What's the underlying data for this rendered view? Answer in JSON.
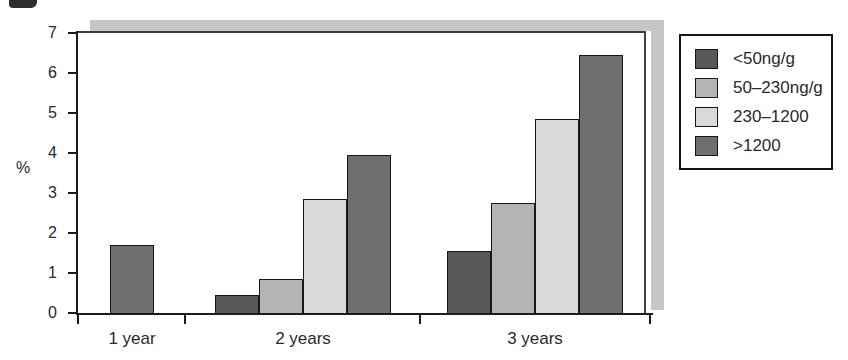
{
  "chart_data": {
    "type": "bar",
    "title": "",
    "xlabel": "",
    "ylabel": "%",
    "ylim": [
      0,
      7
    ],
    "yticks": [
      0,
      1,
      2,
      3,
      4,
      5,
      6,
      7
    ],
    "grid": false,
    "legend_position": "right",
    "categories": [
      "1 year",
      "2 years",
      "3 years"
    ],
    "series": [
      {
        "name": "<50ng/g",
        "color": "#585858",
        "values": [
          null,
          0.45,
          1.55
        ]
      },
      {
        "name": "50–230ng/g",
        "color": "#b4b4b4",
        "values": [
          null,
          0.85,
          2.75
        ]
      },
      {
        "name": "230–1200",
        "color": "#d9d9d9",
        "values": [
          null,
          2.85,
          4.85
        ]
      },
      {
        "name": ">1200",
        "color": "#6e6e6e",
        "values": [
          1.7,
          3.95,
          6.45
        ]
      }
    ]
  }
}
